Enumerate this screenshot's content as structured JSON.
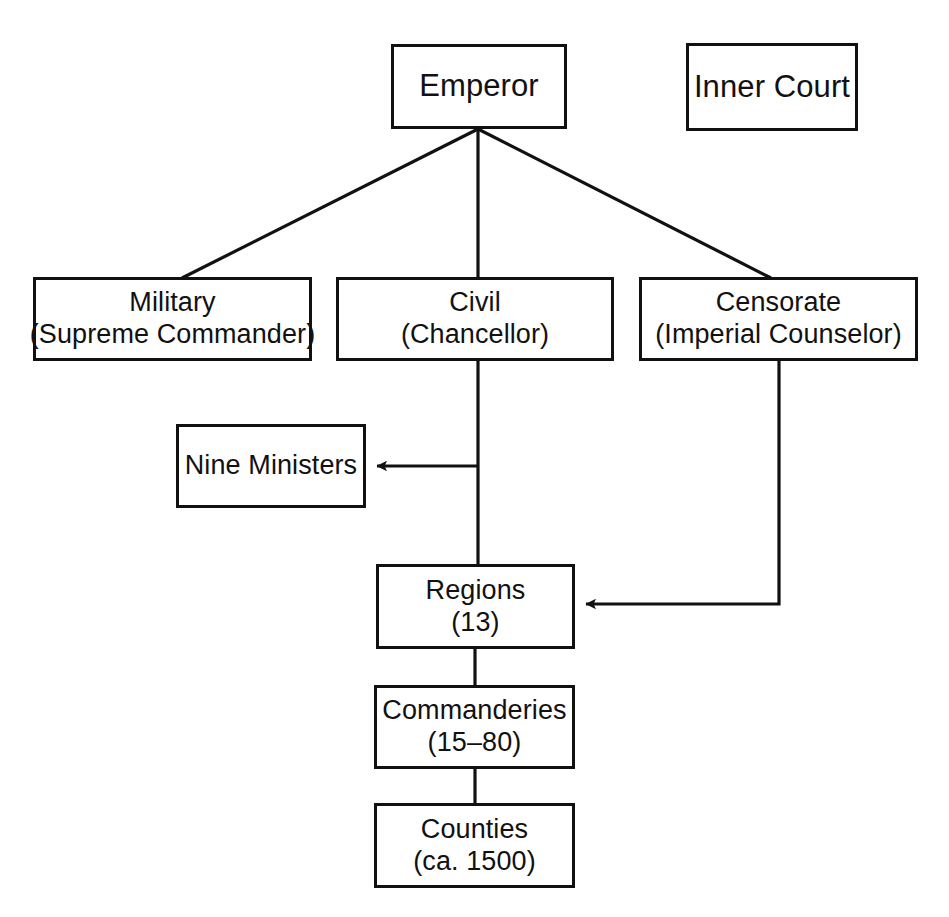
{
  "diagram": {
    "type": "org-chart",
    "line_color": "#111111",
    "background_color": "#ffffff",
    "nodes": [
      {
        "id": "emperor",
        "title": "Emperor",
        "sub": "",
        "x": 391,
        "y": 44,
        "w": 176,
        "h": 85,
        "font": "big"
      },
      {
        "id": "inner-court",
        "title": "Inner Court",
        "sub": "",
        "x": 686,
        "y": 43,
        "w": 172,
        "h": 88,
        "font": "big"
      },
      {
        "id": "military",
        "title": "Military",
        "sub": "(Supreme Commander)",
        "x": 33,
        "y": 277,
        "w": 279,
        "h": 84,
        "font": "normal"
      },
      {
        "id": "civil",
        "title": "Civil",
        "sub": "(Chancellor)",
        "x": 336,
        "y": 277,
        "w": 278,
        "h": 84,
        "font": "normal"
      },
      {
        "id": "censorate",
        "title": "Censorate",
        "sub": "(Imperial Counselor)",
        "x": 639,
        "y": 277,
        "w": 279,
        "h": 84,
        "font": "normal"
      },
      {
        "id": "nine-ministers",
        "title": "Nine Ministers",
        "sub": "",
        "x": 176,
        "y": 424,
        "w": 190,
        "h": 84,
        "font": "normal"
      },
      {
        "id": "regions",
        "title": "Regions",
        "sub": "(13)",
        "x": 376,
        "y": 564,
        "w": 199,
        "h": 85,
        "font": "normal"
      },
      {
        "id": "commanderies",
        "title": "Commanderies",
        "sub": "(15–80)",
        "x": 374,
        "y": 685,
        "w": 201,
        "h": 84,
        "font": "normal"
      },
      {
        "id": "counties",
        "title": "Counties",
        "sub": "(ca. 1500)",
        "x": 374,
        "y": 803,
        "w": 201,
        "h": 85,
        "font": "normal"
      }
    ],
    "edges": [
      {
        "id": "emperor-to-military",
        "from": "emperor",
        "to": "military",
        "kind": "diagonal",
        "arrow": false
      },
      {
        "id": "emperor-to-civil",
        "from": "emperor",
        "to": "civil",
        "kind": "straight",
        "arrow": false
      },
      {
        "id": "emperor-to-censorate",
        "from": "emperor",
        "to": "censorate",
        "kind": "diagonal",
        "arrow": false
      },
      {
        "id": "civil-to-nine-ministers",
        "from": "civil",
        "to": "nine-ministers",
        "kind": "elbow",
        "arrow": true
      },
      {
        "id": "civil-to-regions",
        "from": "civil",
        "to": "regions",
        "kind": "straight",
        "arrow": false
      },
      {
        "id": "censorate-to-regions",
        "from": "censorate",
        "to": "regions",
        "kind": "elbow",
        "arrow": true
      },
      {
        "id": "regions-to-commanderies",
        "from": "regions",
        "to": "commanderies",
        "kind": "straight",
        "arrow": false
      },
      {
        "id": "commanderies-to-counties",
        "from": "commanderies",
        "to": "counties",
        "kind": "straight",
        "arrow": false
      }
    ]
  }
}
